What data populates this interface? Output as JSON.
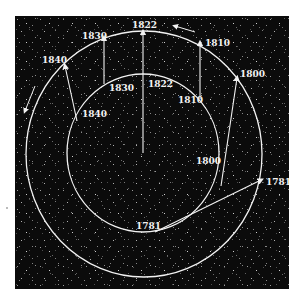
{
  "diagram": {
    "type": "orbital-perturbation-diagram",
    "background_color": "#0b0b0b",
    "line_color": "#f2f2f2",
    "outer_orbit": {
      "name": "outer orbit",
      "labels": [
        "1822",
        "1810",
        "1800",
        "1781",
        "1830",
        "1840"
      ]
    },
    "inner_orbit": {
      "name": "inner orbit",
      "labels": [
        "1822",
        "1810",
        "1800",
        "1781",
        "1830",
        "1840"
      ]
    },
    "labels": {
      "outer_1822": "1822",
      "outer_1830": "1830",
      "outer_1840": "1840",
      "outer_1810": "1810",
      "outer_1800": "1800",
      "outer_1781": "1781",
      "inner_1822": "1822",
      "inner_1830": "1830",
      "inner_1840": "1840",
      "inner_1810": "1810",
      "inner_1800": "1800",
      "inner_1781": "1781"
    },
    "direction_arrows": [
      "counterclockwise-top",
      "counterclockwise-left"
    ]
  }
}
